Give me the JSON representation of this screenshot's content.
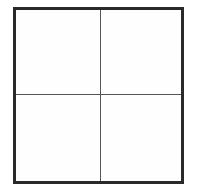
{
  "diagram": {
    "type": "grid",
    "rows": 2,
    "columns": 2,
    "cells": [
      {
        "row": 0,
        "col": 0,
        "label": ""
      },
      {
        "row": 0,
        "col": 1,
        "label": ""
      },
      {
        "row": 1,
        "col": 0,
        "label": ""
      },
      {
        "row": 1,
        "col": 1,
        "label": ""
      }
    ],
    "colors": {
      "border": "#2a2a2a",
      "divider": "#555555",
      "background": "#ffffff"
    }
  }
}
